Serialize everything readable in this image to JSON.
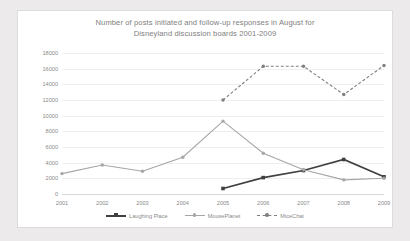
{
  "chart_data": {
    "type": "line",
    "title": "Number of posts initiated and follow-up responses in August for Disneyland discussion boards 2001-2009",
    "title_line1": "Number of posts initiated and follow-up responses in August for",
    "title_line2": "Disneyland discussion boards 2001-2009",
    "xlabel": "",
    "ylabel": "",
    "categories": [
      "2001",
      "2002",
      "2003",
      "2004",
      "2005",
      "2006",
      "2007",
      "2008",
      "2009"
    ],
    "ylim": [
      0,
      18000
    ],
    "yticks": [
      0,
      2000,
      4000,
      6000,
      8000,
      10000,
      12000,
      14000,
      16000,
      18000
    ],
    "ytick_labels": [
      "0",
      "2000",
      "4000",
      "6000",
      "8000",
      "10000",
      "12000",
      "14000",
      "16000",
      "18000"
    ],
    "grid": true,
    "legend_position": "bottom",
    "series": [
      {
        "name": "Laughing Place",
        "color": "#404040",
        "style": "solid",
        "marker": "square",
        "values": [
          null,
          null,
          null,
          null,
          700,
          2100,
          3000,
          4400,
          2200
        ]
      },
      {
        "name": "MousePlanet",
        "color": "#a6a6a6",
        "style": "solid",
        "marker": "circle",
        "values": [
          2600,
          3700,
          2900,
          4700,
          9300,
          5200,
          3100,
          1800,
          2000
        ]
      },
      {
        "name": "MiceChat",
        "color": "#808080",
        "style": "dashed",
        "marker": "circle",
        "values": [
          null,
          null,
          null,
          null,
          12000,
          16300,
          16300,
          12700,
          16400
        ]
      }
    ]
  }
}
